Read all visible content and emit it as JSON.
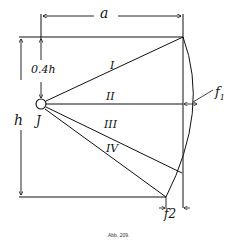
{
  "figure": {
    "caption": "Abb. 209.",
    "labels": {
      "a": "a",
      "h": "h",
      "offset": "0.4h",
      "pivot": "J",
      "f1": "f",
      "f1_sub": "1",
      "f2": "f2"
    },
    "lines": [
      {
        "id": "I",
        "label": "I"
      },
      {
        "id": "II",
        "label": "II"
      },
      {
        "id": "III",
        "label": "III"
      },
      {
        "id": "IV",
        "label": "IV"
      }
    ],
    "colors": {
      "ink": "#111111",
      "paper": "#ffffff"
    }
  }
}
